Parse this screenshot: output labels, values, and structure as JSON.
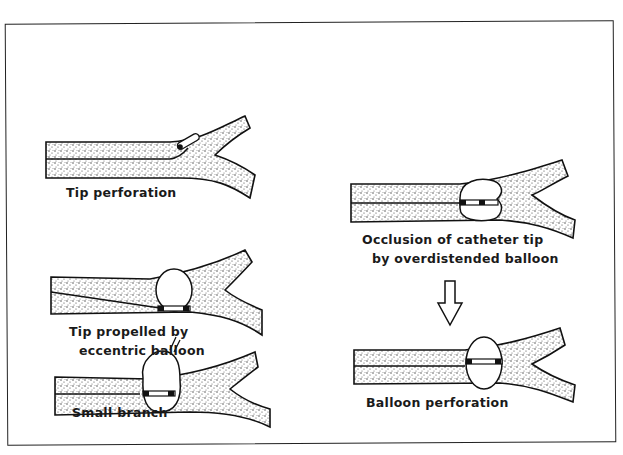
{
  "figure": {
    "panels": [
      {
        "id": "tip-perforation",
        "caption": [
          "Tip perforation"
        ]
      },
      {
        "id": "tip-propelled",
        "caption": [
          "Tip propelled by",
          "eccentric balloon"
        ]
      },
      {
        "id": "small-branch",
        "caption": [
          "Small branch"
        ]
      },
      {
        "id": "occlusion",
        "caption": [
          "Occlusion of catheter tip",
          "by overdistended balloon"
        ]
      },
      {
        "id": "balloon-perforation",
        "caption": [
          "Balloon perforation"
        ]
      }
    ],
    "arrow": {
      "direction": "down",
      "from": "occlusion",
      "to": "balloon-perforation"
    }
  }
}
